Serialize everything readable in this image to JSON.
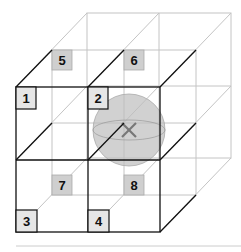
{
  "diagram": {
    "cells": [
      {
        "label": "1",
        "layer": "front",
        "row": "top",
        "col": "left"
      },
      {
        "label": "2",
        "layer": "front",
        "row": "top",
        "col": "right"
      },
      {
        "label": "3",
        "layer": "front",
        "row": "bottom",
        "col": "left"
      },
      {
        "label": "4",
        "layer": "front",
        "row": "bottom",
        "col": "right"
      },
      {
        "label": "5",
        "layer": "back",
        "row": "top",
        "col": "left"
      },
      {
        "label": "6",
        "layer": "back",
        "row": "top",
        "col": "right"
      },
      {
        "label": "7",
        "layer": "back",
        "row": "bottom",
        "col": "left"
      },
      {
        "label": "8",
        "layer": "back",
        "row": "bottom",
        "col": "right"
      }
    ],
    "query_marker": "x-mark",
    "colors": {
      "front_lines": "#111111",
      "back_lines": "#bbbbbb",
      "front_label_fill": "#e6e6e6",
      "back_label_fill": "#cfcfcf",
      "sphere_fill": "#bdbdbd",
      "marker": "#777777"
    }
  }
}
